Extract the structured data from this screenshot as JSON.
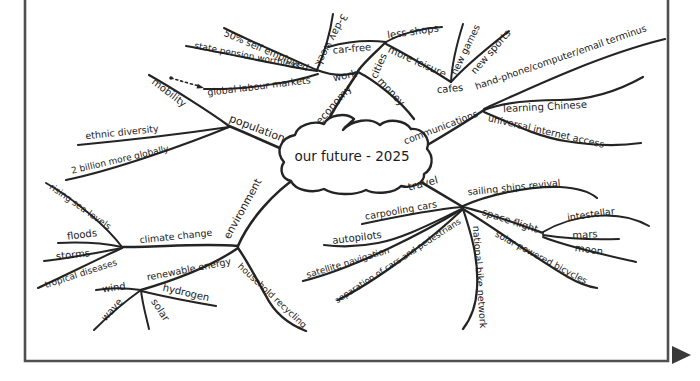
{
  "frame": {
    "color": "#4f4f4f",
    "width": 2.6,
    "path": "M25,0 L25,361 L668,361 L668,0",
    "scroll_arrow": {
      "points": "672,346 691,355 672,364",
      "color": "#3a3a3a"
    }
  },
  "diagram": {
    "ink": "#242424",
    "background": "#ffffff",
    "center_label": "our future - 2025",
    "cloud_path": "M284,162 C275,152 280,138 295,135 C297,126 312,120 324,124 C328,115 346,112 354,119 C351,123 345,126 343,130 C352,120 370,117 380,125 C388,118 405,120 411,129 C422,128 431,138 427,149 C434,156 433,169 424,174 C425,183 412,189 401,186 C395,193 376,195 366,190 C354,196 334,195 324,189 C312,194 295,190 291,181 C282,179 279,170 284,162 Z",
    "dotted_link": {
      "d": "M171,78 C181,81 191,84 199,86",
      "dot": [
        171,
        78
      ],
      "head_points": "204,88 196.5,88.6 197.8,83.8"
    },
    "nodes": [
      {
        "id": "center",
        "label": "our future - 2025",
        "x": 352,
        "y": 157,
        "rot": 0,
        "fs": 13.5
      },
      {
        "id": "population",
        "label": "population",
        "x": 257,
        "y": 129,
        "rot": 21,
        "fs": 11
      },
      {
        "id": "mobility",
        "label": "mobility",
        "x": 169,
        "y": 93,
        "rot": 37,
        "fs": 10
      },
      {
        "id": "ethnic-diversity",
        "label": "ethnic diversity",
        "x": 122,
        "y": 133,
        "rot": -6,
        "fs": 9.5
      },
      {
        "id": "two-billion",
        "label": "2 billion more globally",
        "x": 120,
        "y": 160,
        "rot": -13,
        "fs": 9
      },
      {
        "id": "economy",
        "label": "economy",
        "x": 334,
        "y": 105,
        "rot": -49,
        "fs": 10.5
      },
      {
        "id": "work",
        "label": "work",
        "x": 345,
        "y": 76,
        "rot": -12,
        "fs": 10
      },
      {
        "id": "three-day-week",
        "label": "3-day week",
        "x": 331,
        "y": 40,
        "rot": 118,
        "fs": 10
      },
      {
        "id": "self-employed",
        "label": "50% self employed",
        "x": 266,
        "y": 51,
        "rot": 23,
        "fs": 9.5
      },
      {
        "id": "state-pension",
        "label": "state pension worthless",
        "x": 247,
        "y": 56,
        "rot": 11,
        "fs": 9
      },
      {
        "id": "global-labour",
        "label": "global labour markets",
        "x": 259,
        "y": 87,
        "rot": -7,
        "fs": 9.5
      },
      {
        "id": "cities",
        "label": "cities",
        "x": 379,
        "y": 66,
        "rot": -66,
        "fs": 10
      },
      {
        "id": "car-free",
        "label": "car-free",
        "x": 352,
        "y": 49,
        "rot": -5,
        "fs": 10
      },
      {
        "id": "less-shops",
        "label": "less shops",
        "x": 413,
        "y": 32,
        "rot": -8,
        "fs": 10
      },
      {
        "id": "more-leisure",
        "label": "more leisure",
        "x": 417,
        "y": 62,
        "rot": 24,
        "fs": 10
      },
      {
        "id": "money",
        "label": "money",
        "x": 391,
        "y": 92,
        "rot": 47,
        "fs": 10
      },
      {
        "id": "cafes",
        "label": "cafes",
        "x": 450,
        "y": 89,
        "rot": -6,
        "fs": 10
      },
      {
        "id": "new-games",
        "label": "new games",
        "x": 466,
        "y": 50,
        "rot": -64,
        "fs": 9.5
      },
      {
        "id": "new-sports",
        "label": "new sports",
        "x": 491,
        "y": 52,
        "rot": -49,
        "fs": 10
      },
      {
        "id": "communications",
        "label": "communications",
        "x": 441,
        "y": 128,
        "rot": -21,
        "fs": 9.5
      },
      {
        "id": "hand-phone",
        "label": "hand-phone/computer/email terminus",
        "x": 561,
        "y": 58,
        "rot": -19,
        "fs": 9.5
      },
      {
        "id": "learning-chinese",
        "label": "learning Chinese",
        "x": 545,
        "y": 107,
        "rot": -3,
        "fs": 10
      },
      {
        "id": "universal-internet",
        "label": "universal internet access",
        "x": 546,
        "y": 132,
        "rot": 13,
        "fs": 9.5
      },
      {
        "id": "travel",
        "label": "travel",
        "x": 423,
        "y": 184,
        "rot": -15,
        "fs": 10.5
      },
      {
        "id": "sailing-ships",
        "label": "sailing ships revival",
        "x": 514,
        "y": 188,
        "rot": -6,
        "fs": 9.5
      },
      {
        "id": "space-flight",
        "label": "space flight",
        "x": 510,
        "y": 221,
        "rot": 18,
        "fs": 10
      },
      {
        "id": "intestellar",
        "label": "intestellar",
        "x": 591,
        "y": 215,
        "rot": -8,
        "fs": 9.5
      },
      {
        "id": "mars",
        "label": "mars",
        "x": 585,
        "y": 235,
        "rot": -3,
        "fs": 10
      },
      {
        "id": "moon",
        "label": "moon",
        "x": 589,
        "y": 250,
        "rot": 8,
        "fs": 10
      },
      {
        "id": "solar-bicycles",
        "label": "solar powered bicycles",
        "x": 541,
        "y": 258,
        "rot": 28,
        "fs": 9
      },
      {
        "id": "bike-network",
        "label": "national bike network",
        "x": 479,
        "y": 277,
        "rot": 86,
        "fs": 9.5
      },
      {
        "id": "carpooling",
        "label": "carpooling cars",
        "x": 401,
        "y": 211,
        "rot": -10,
        "fs": 9.5
      },
      {
        "id": "autopilots",
        "label": "autopilots",
        "x": 357,
        "y": 238,
        "rot": -7,
        "fs": 10
      },
      {
        "id": "satellite-nav",
        "label": "satellite navigation",
        "x": 348,
        "y": 263,
        "rot": -17,
        "fs": 9
      },
      {
        "id": "separation",
        "label": "separation of cars and pedestrians",
        "x": 398,
        "y": 261,
        "rot": -33,
        "fs": 8.5
      },
      {
        "id": "environment",
        "label": "environment",
        "x": 243,
        "y": 209,
        "rot": -61,
        "fs": 10.5
      },
      {
        "id": "climate-change",
        "label": "climate change",
        "x": 176,
        "y": 237,
        "rot": -6,
        "fs": 9.5
      },
      {
        "id": "rising-sea",
        "label": "rising sea-levels",
        "x": 80,
        "y": 207,
        "rot": 35,
        "fs": 9
      },
      {
        "id": "floods",
        "label": "floods",
        "x": 82,
        "y": 235,
        "rot": -7,
        "fs": 10
      },
      {
        "id": "storms",
        "label": "storms",
        "x": 73,
        "y": 255,
        "rot": -6,
        "fs": 10
      },
      {
        "id": "tropical-diseases",
        "label": "tropical diseases",
        "x": 81,
        "y": 274,
        "rot": -18,
        "fs": 9
      },
      {
        "id": "renewable-energy",
        "label": "renewable energy",
        "x": 189,
        "y": 270,
        "rot": -11,
        "fs": 9.5
      },
      {
        "id": "wind",
        "label": "wind",
        "x": 114,
        "y": 288,
        "rot": -8,
        "fs": 10
      },
      {
        "id": "wave",
        "label": "wave",
        "x": 112,
        "y": 310,
        "rot": -48,
        "fs": 10
      },
      {
        "id": "solar",
        "label": "solar",
        "x": 160,
        "y": 310,
        "rot": 57,
        "fs": 10
      },
      {
        "id": "hydrogen",
        "label": "hydrogen",
        "x": 186,
        "y": 293,
        "rot": 13,
        "fs": 10
      },
      {
        "id": "household-recycling",
        "label": "household recycling",
        "x": 272,
        "y": 296,
        "rot": 43,
        "fs": 9
      }
    ],
    "edges": [
      {
        "id": "population",
        "d": "M284,150 C266,142 246,133 229,126",
        "w": 2.6
      },
      {
        "id": "mobility",
        "d": "M229,126 C210,112 172,88 149,75",
        "w": 2.2
      },
      {
        "id": "ethnic-diversity",
        "d": "M229,127 C195,132 130,140 78,145",
        "w": 2.2
      },
      {
        "id": "two-billion",
        "d": "M229,127 C190,143 115,170 66,180",
        "w": 2.2
      },
      {
        "id": "economy",
        "d": "M323,131 C330,114 346,90 358,72",
        "w": 2.6
      },
      {
        "id": "work",
        "d": "M358,72 C345,77 330,75 317,70",
        "w": 2.4
      },
      {
        "id": "three-day-week",
        "d": "M317,70 C323,56 330,34 333,14",
        "w": 2
      },
      {
        "id": "self-employed",
        "d": "M317,70 C292,59 254,43 224,28",
        "w": 2
      },
      {
        "id": "state-pension",
        "d": "M317,71 C282,66 226,53 186,46",
        "w": 2
      },
      {
        "id": "global-labour",
        "d": "M318,74 C288,84 240,90 204,89",
        "w": 2
      },
      {
        "id": "cities",
        "d": "M358,71 C364,62 376,52 386,42",
        "w": 2.4
      },
      {
        "id": "car-free",
        "d": "M386,42 C368,40 346,42 328,47",
        "w": 2
      },
      {
        "id": "less-shops",
        "d": "M386,42 C400,34 422,28 442,27",
        "w": 2
      },
      {
        "id": "more-leisure",
        "d": "M386,44 C406,54 432,70 451,82",
        "w": 2.2
      },
      {
        "id": "new-games",
        "d": "M451,82 C452,62 458,40 463,24",
        "w": 2
      },
      {
        "id": "new-sports",
        "d": "M451,82 C468,63 490,46 509,31",
        "w": 2
      },
      {
        "id": "money",
        "d": "M358,72 C374,80 400,100 414,119",
        "w": 2.4
      },
      {
        "id": "communications",
        "d": "M424,147 C441,137 466,122 484,110",
        "w": 2.6
      },
      {
        "id": "hand-phone",
        "d": "M484,109 C530,88 600,55 665,39",
        "w": 2.2
      },
      {
        "id": "learning-chinese",
        "d": "M484,110 C505,102 535,100 560,100 C590,100 620,90 643,77",
        "w": 2.2
      },
      {
        "id": "universal-internet",
        "d": "M484,112 C508,122 535,136 565,141 C595,146 620,146 641,143",
        "w": 2.2
      },
      {
        "id": "travel",
        "d": "M407,174 C424,184 448,198 463,207",
        "w": 2.6
      },
      {
        "id": "sailing-ships",
        "d": "M463,206 C485,196 525,186 560,187 C578,188 590,192 597,198",
        "w": 2.2
      },
      {
        "id": "space-flight",
        "d": "M463,207 C488,213 518,224 543,233",
        "w": 2.2
      },
      {
        "id": "intestellar",
        "d": "M543,232 C572,215 618,208 649,226",
        "w": 2
      },
      {
        "id": "mars",
        "d": "M543,235 C570,239 596,240 619,239",
        "w": 2
      },
      {
        "id": "moon",
        "d": "M543,237 C568,247 605,255 636,262",
        "w": 2
      },
      {
        "id": "solar-bicycles",
        "d": "M463,209 C492,226 535,258 568,277 C580,284 590,287 597,288",
        "w": 2.2
      },
      {
        "id": "bike-network",
        "d": "M463,209 C470,230 479,258 477,288 C476,308 470,320 463,329",
        "w": 2.2
      },
      {
        "id": "separation",
        "d": "M462,210 C430,240 378,280 338,300",
        "w": 2.2
      },
      {
        "id": "satellite-nav",
        "d": "M462,209 C425,232 355,268 303,281",
        "w": 2.2
      },
      {
        "id": "autopilots",
        "d": "M462,209 C438,220 405,238 378,243 C358,247 340,247 324,245",
        "w": 2.2
      },
      {
        "id": "carpooling",
        "d": "M462,207 C438,209 400,216 362,224",
        "w": 2.2
      },
      {
        "id": "environment",
        "d": "M296,178 C276,191 250,218 238,246",
        "w": 2.6
      },
      {
        "id": "climate-change",
        "d": "M238,246 C205,243 160,247 122,247",
        "w": 2.4
      },
      {
        "id": "rising-sea",
        "d": "M122,247 C108,228 76,200 46,183",
        "w": 2
      },
      {
        "id": "floods",
        "d": "M122,247 C103,243 80,242 58,243",
        "w": 2
      },
      {
        "id": "storms",
        "d": "M122,248 C100,252 72,258 44,261",
        "w": 2
      },
      {
        "id": "tropical-diseases",
        "d": "M122,248 C96,260 64,276 38,288",
        "w": 2
      },
      {
        "id": "renewable-energy",
        "d": "M238,248 C212,266 175,280 141,290",
        "w": 2.4
      },
      {
        "id": "wind",
        "d": "M141,290 C128,288 113,287 96,290",
        "w": 2
      },
      {
        "id": "wave",
        "d": "M141,290 C127,300 108,316 94,330",
        "w": 2
      },
      {
        "id": "solar",
        "d": "M141,290 C142,302 146,316 149,329",
        "w": 2
      },
      {
        "id": "hydrogen",
        "d": "M141,291 C166,297 192,302 216,306",
        "w": 2
      },
      {
        "id": "household-recycling",
        "d": "M238,248 C248,262 258,282 266,296 C274,312 288,324 306,331",
        "w": 2.4
      }
    ]
  }
}
